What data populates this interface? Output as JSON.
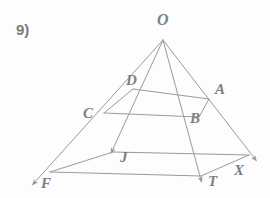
{
  "problem": {
    "number_label": "9)"
  },
  "figure": {
    "type": "geometry-diagram",
    "line_color": "#9a9a9a",
    "label_color": "#808080",
    "background_color": "#fdfdfd",
    "stroke_width": 1
  },
  "labels": {
    "apex": "O",
    "d": "D",
    "a": "A",
    "c": "C",
    "b": "B",
    "j": "J",
    "f": "F",
    "t": "T",
    "x": "X"
  },
  "points": {
    "O": {
      "x": 163,
      "y": 40
    },
    "D": {
      "x": 133,
      "y": 89
    },
    "A": {
      "x": 209,
      "y": 99
    },
    "C": {
      "x": 104,
      "y": 113
    },
    "B": {
      "x": 199,
      "y": 117
    },
    "J": {
      "x": 113,
      "y": 152
    },
    "F": {
      "x": 50,
      "y": 172
    },
    "T": {
      "x": 201,
      "y": 176
    },
    "X": {
      "x": 249,
      "y": 155
    }
  },
  "rays": [
    {
      "name": "ray-OF",
      "from": "O",
      "arrow_at": {
        "x": 31,
        "y": 186
      }
    },
    {
      "name": "ray-OJ",
      "from": "O",
      "arrow_at": {
        "x": 108,
        "y": 155
      }
    },
    {
      "name": "ray-OT",
      "from": "O",
      "arrow_at": {
        "x": 200,
        "y": 184
      }
    },
    {
      "name": "ray-OX",
      "from": "O",
      "arrow_at": {
        "x": 258,
        "y": 162
      }
    }
  ],
  "cross_sections": [
    {
      "name": "upper-section",
      "vertices": [
        "D",
        "A",
        "B",
        "C"
      ]
    },
    {
      "name": "lower-section",
      "vertices": [
        "J",
        "X",
        "T",
        "F"
      ]
    }
  ]
}
